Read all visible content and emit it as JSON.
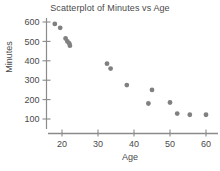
{
  "chart_data": {
    "type": "scatter",
    "title": "Scatterplot of Minutes vs Age",
    "xlabel": "Age",
    "ylabel": "Minutes",
    "xlim": [
      15,
      63
    ],
    "ylim": [
      95,
      620
    ],
    "xticks": [
      20,
      30,
      40,
      50,
      60
    ],
    "yticks": [
      100,
      200,
      300,
      400,
      500,
      600
    ],
    "grid": false,
    "legend": null,
    "marker_color": "#808080",
    "axis_color": "#8a8a8a",
    "series": [
      {
        "name": "Minutes vs Age",
        "points": [
          {
            "x": 18.0,
            "y": 590
          },
          {
            "x": 19.5,
            "y": 570
          },
          {
            "x": 21.0,
            "y": 515
          },
          {
            "x": 21.5,
            "y": 500
          },
          {
            "x": 22.0,
            "y": 490
          },
          {
            "x": 22.2,
            "y": 478
          },
          {
            "x": 32.5,
            "y": 385
          },
          {
            "x": 33.5,
            "y": 360
          },
          {
            "x": 38.0,
            "y": 275
          },
          {
            "x": 44.0,
            "y": 180
          },
          {
            "x": 45.0,
            "y": 250
          },
          {
            "x": 50.0,
            "y": 185
          },
          {
            "x": 52.0,
            "y": 128
          },
          {
            "x": 55.5,
            "y": 122
          },
          {
            "x": 60.0,
            "y": 122
          }
        ]
      }
    ]
  }
}
